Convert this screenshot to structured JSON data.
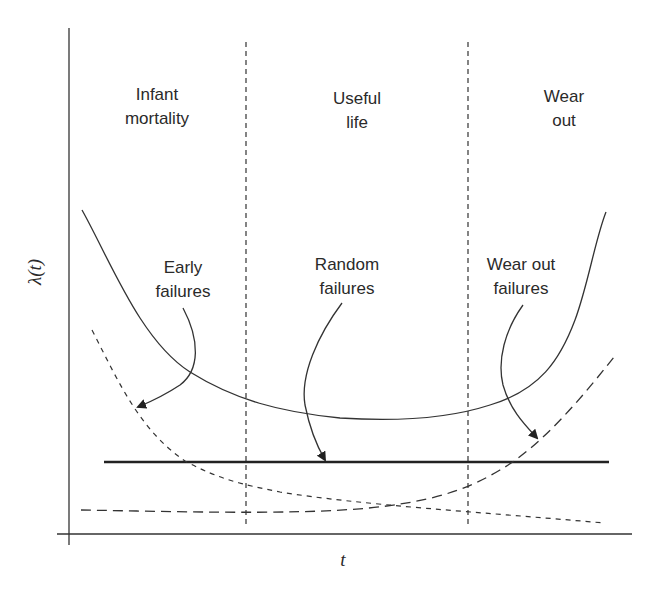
{
  "diagram": {
    "type": "bathtub-curve",
    "axes": {
      "y_label": "λ(t)",
      "x_label": "t"
    },
    "regions": [
      {
        "line1": "Infant",
        "line2": "mortality"
      },
      {
        "line1": "Useful",
        "line2": "life"
      },
      {
        "line1": "Wear",
        "line2": "out"
      }
    ],
    "annotations": [
      {
        "line1": "Early",
        "line2": "failures"
      },
      {
        "line1": "Random",
        "line2": "failures"
      },
      {
        "line1": "Wear out",
        "line2": "failures"
      }
    ],
    "curves": [
      {
        "name": "total-failure-rate",
        "style": "solid"
      },
      {
        "name": "early-failures",
        "style": "short-dashed"
      },
      {
        "name": "random-failures",
        "style": "thick-solid"
      },
      {
        "name": "wear-out-failures",
        "style": "long-dashed"
      }
    ],
    "colors": {
      "ink": "#2a2a2a",
      "background": "#ffffff"
    }
  }
}
